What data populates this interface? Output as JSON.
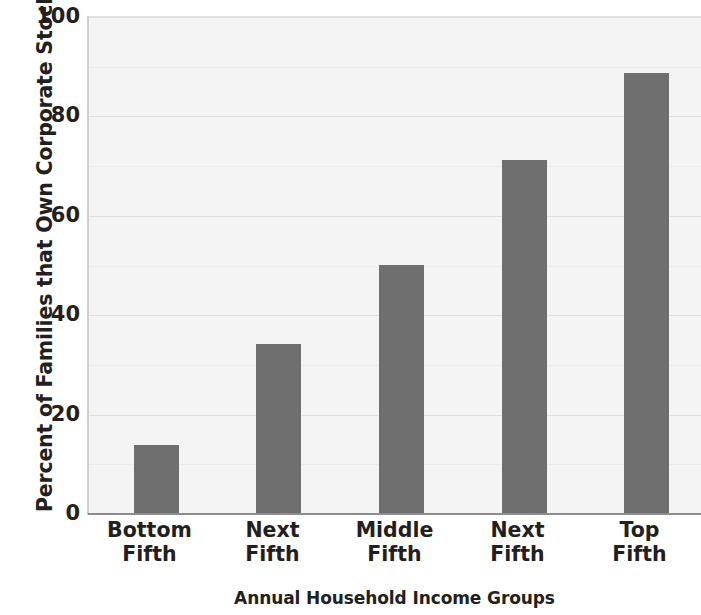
{
  "chart_data": {
    "type": "bar",
    "title": "",
    "subtitle": "",
    "xlabel": "Annual Household Income Groups",
    "ylabel": "Percent of Families that Own Corporate Stock",
    "categories": [
      "Bottom\nFifth",
      "Next\nFifth",
      "Middle\nFifth",
      "Next\nFifth",
      "Top\nFifth"
    ],
    "values": [
      13.7,
      34,
      50,
      71,
      88.5
    ],
    "ylim": [
      0,
      100
    ],
    "yticks": [
      0,
      20,
      40,
      60,
      80,
      100
    ],
    "ytick_labels": [
      "0",
      "20",
      "40",
      "60",
      "80",
      "100"
    ],
    "grid": true,
    "legend": "none",
    "bar_color": "#706f6f",
    "plot_background": "#f4f4f4",
    "gridline_color": "#e0e0e0",
    "axis_color": "#8d8d8d",
    "text_color": "#231f20"
  },
  "axes": {
    "y_title": "Percent of Families that Own Corporate Stock",
    "x_title": "Annual Household Income Groups",
    "y_labels": [
      "100",
      "80",
      "60",
      "40",
      "20",
      "0"
    ],
    "x_labels": [
      {
        "line1": "Bottom",
        "line2": "Fifth"
      },
      {
        "line1": "Next",
        "line2": "Fifth"
      },
      {
        "line1": "Middle",
        "line2": "Fifth"
      },
      {
        "line1": "Next",
        "line2": "Fifth"
      },
      {
        "line1": "Top",
        "line2": "Fifth"
      }
    ]
  }
}
